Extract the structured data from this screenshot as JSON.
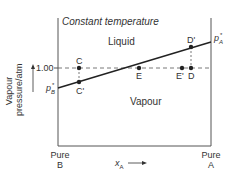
{
  "title": "Constant temperature",
  "regions": {
    "upper": "Liquid",
    "lower": "Vapour"
  },
  "y_axis": {
    "label_line1": "Vapour",
    "label_line2": "pressure/atm",
    "tick": "1.00"
  },
  "x_axis": {
    "label": "x",
    "label_sub": "A",
    "left_end_line1": "Pure",
    "left_end_line2": "B",
    "right_end_line1": "Pure",
    "right_end_line2": "A"
  },
  "endpoints": {
    "left": {
      "symbol": "p",
      "sub": "B",
      "sup": "*"
    },
    "right": {
      "symbol": "p",
      "sub": "A",
      "sup": "*"
    }
  },
  "points": [
    {
      "id": "C",
      "label": "C"
    },
    {
      "id": "C_prime",
      "label": "C'"
    },
    {
      "id": "E",
      "label": "E"
    },
    {
      "id": "E_prime",
      "label": "E'"
    },
    {
      "id": "D",
      "label": "D"
    },
    {
      "id": "D_prime",
      "label": "D'"
    }
  ],
  "colors": {
    "line": "#222222",
    "text": "#333333"
  }
}
